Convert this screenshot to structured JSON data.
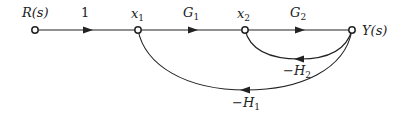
{
  "diagram": {
    "type": "signal-flow-graph",
    "nodes": [
      {
        "id": "R",
        "label": "R(s)"
      },
      {
        "id": "x1",
        "label": "x",
        "sub": "1"
      },
      {
        "id": "x2",
        "label": "x",
        "sub": "2"
      },
      {
        "id": "Y",
        "label": "Y(s)"
      }
    ],
    "edges": [
      {
        "from": "R",
        "to": "x1",
        "gain": "1"
      },
      {
        "from": "x1",
        "to": "x2",
        "gain": "G",
        "sub": "1"
      },
      {
        "from": "x2",
        "to": "Y",
        "gain": "G",
        "sub": "2"
      },
      {
        "from": "Y",
        "to": "x2",
        "gain": "−H",
        "sub": "2"
      },
      {
        "from": "Y",
        "to": "x1",
        "gain": "−H",
        "sub": "1"
      }
    ]
  }
}
